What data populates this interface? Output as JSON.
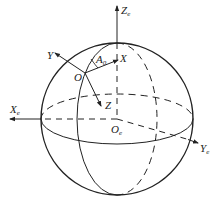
{
  "diagram": {
    "type": "earth-centered coordinate frame on sphere",
    "colors": {
      "stroke": "#222222",
      "background": "#ffffff"
    },
    "labels": {
      "Ze": {
        "main": "Z",
        "sub": "e"
      },
      "Xe": {
        "main": "X",
        "sub": "e"
      },
      "Ye": {
        "main": "Y",
        "sub": "e"
      },
      "Oe": {
        "main": "O",
        "sub": "e"
      },
      "O": {
        "main": "O"
      },
      "X": {
        "main": "X"
      },
      "Y": {
        "main": "Y"
      },
      "Z": {
        "main": "Z"
      },
      "A0": {
        "main": "A",
        "sub": "0"
      }
    }
  }
}
